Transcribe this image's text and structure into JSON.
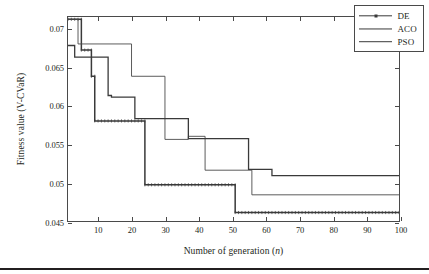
{
  "chart_data": {
    "type": "line",
    "title": "",
    "xlabel": "Number of generation (n)",
    "ylabel": "Fitness value (V-CVaR)",
    "xlim": [
      1,
      100
    ],
    "ylim": [
      0.045,
      0.0715
    ],
    "grid": false,
    "legend_position": "top-right",
    "xticks": [
      10,
      20,
      30,
      40,
      50,
      60,
      70,
      80,
      90,
      100
    ],
    "xtick_labels": [
      "10",
      "20",
      "30",
      "40",
      "50",
      "60",
      "70",
      "80",
      "90",
      "100"
    ],
    "yticks": [
      0.045,
      0.05,
      0.055,
      0.06,
      0.065,
      0.07
    ],
    "ytick_labels": [
      "0.045",
      "0.05",
      "0.055",
      "0.06",
      "0.065",
      "0.07"
    ],
    "series": [
      {
        "name": "DE",
        "style": "line-with-markers",
        "color": "#3a3a3a",
        "final_value": 0.0461,
        "x": [
          1,
          4,
          5,
          7,
          8,
          9,
          23,
          24,
          50,
          51,
          100
        ],
        "y": [
          0.0712,
          0.0712,
          0.0672,
          0.0672,
          0.0638,
          0.0638,
          0.058,
          0.058,
          0.0497,
          0.0497,
          0.0461
        ],
        "steps": [
          {
            "x_start": 1,
            "x_end": 5,
            "value": 0.0712
          },
          {
            "x_start": 5,
            "x_end": 8,
            "value": 0.0672
          },
          {
            "x_start": 8,
            "x_end": 9,
            "value": 0.0638
          },
          {
            "x_start": 9,
            "x_end": 24,
            "value": 0.058
          },
          {
            "x_start": 24,
            "x_end": 51,
            "value": 0.0497
          },
          {
            "x_start": 51,
            "x_end": 100,
            "value": 0.0461
          }
        ]
      },
      {
        "name": "ACO",
        "style": "line",
        "color": "#4a4a4a",
        "final_value": 0.0484,
        "steps": [
          {
            "x_start": 1,
            "x_end": 4,
            "value": 0.0712
          },
          {
            "x_start": 4,
            "x_end": 20,
            "value": 0.068
          },
          {
            "x_start": 20,
            "x_end": 30,
            "value": 0.0638
          },
          {
            "x_start": 30,
            "x_end": 37,
            "value": 0.0556
          },
          {
            "x_start": 37,
            "x_end": 42,
            "value": 0.056
          },
          {
            "x_start": 42,
            "x_end": 56,
            "value": 0.0516
          },
          {
            "x_start": 56,
            "x_end": 100,
            "value": 0.0484
          }
        ]
      },
      {
        "name": "PSO",
        "style": "line",
        "color": "#3a3a3a",
        "final_value": 0.0509,
        "steps": [
          {
            "x_start": 1,
            "x_end": 3,
            "value": 0.0678
          },
          {
            "x_start": 3,
            "x_end": 5,
            "value": 0.0663
          },
          {
            "x_start": 5,
            "x_end": 13,
            "value": 0.0663
          },
          {
            "x_start": 13,
            "x_end": 14,
            "value": 0.0613
          },
          {
            "x_start": 14,
            "x_end": 21,
            "value": 0.0611
          },
          {
            "x_start": 21,
            "x_end": 37,
            "value": 0.0583
          },
          {
            "x_start": 37,
            "x_end": 55,
            "value": 0.0557
          },
          {
            "x_start": 55,
            "x_end": 62,
            "value": 0.0517
          },
          {
            "x_start": 62,
            "x_end": 100,
            "value": 0.0509
          }
        ]
      }
    ]
  },
  "legend": {
    "entries": [
      {
        "label": "DE"
      },
      {
        "label": "ACO"
      },
      {
        "label": "PSO"
      }
    ]
  },
  "axes": {
    "x_title_prefix": "Number of generation (",
    "x_title_italic": "n",
    "x_title_suffix": ")",
    "y_title": "Fitness value (V-CVaR)"
  }
}
